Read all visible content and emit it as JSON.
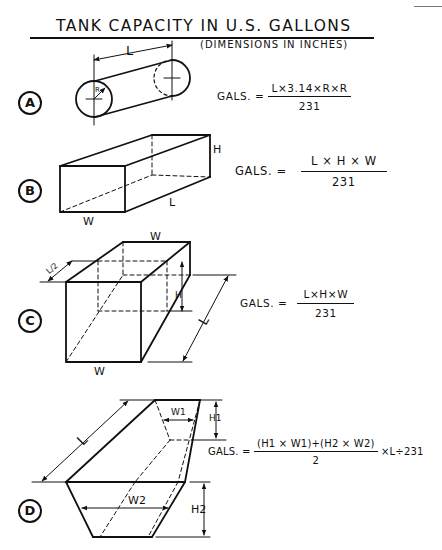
{
  "header": {
    "title": "TANK CAPACITY IN U.S. GALLONS",
    "subtitle": "(DIMENSIONS IN INCHES)"
  },
  "tanks": [
    {
      "id": "A",
      "shape": "cylinder",
      "labels": {
        "length": "L",
        "radius": "R"
      },
      "formula": {
        "lhs": "GALS. =",
        "numerator": "L×3.14×R×R",
        "denominator": "231",
        "suffix": ""
      }
    },
    {
      "id": "B",
      "shape": "rectangular-box",
      "labels": {
        "length": "L",
        "height": "H",
        "width": "W"
      },
      "formula": {
        "lhs": "GALS. =",
        "numerator": "L × H × W",
        "denominator": "231",
        "suffix": ""
      }
    },
    {
      "id": "C",
      "shape": "rectangular-box-partial",
      "labels": {
        "width_top": "W",
        "width_bottom": "W",
        "height": "H",
        "length": "L",
        "partial": "L/2"
      },
      "formula": {
        "lhs": "GALS. =",
        "numerator": "L×H×W",
        "denominator": "231",
        "suffix": ""
      }
    },
    {
      "id": "D",
      "shape": "trapezoidal-tank",
      "labels": {
        "length": "L",
        "w1": "W1",
        "h1": "H1",
        "w2": "W2",
        "h2": "H2"
      },
      "formula": {
        "lhs": "GALS. =",
        "numerator": "(H1 × W1)+(H2 × W2)",
        "denominator": "2",
        "suffix": "×L÷231"
      }
    }
  ]
}
